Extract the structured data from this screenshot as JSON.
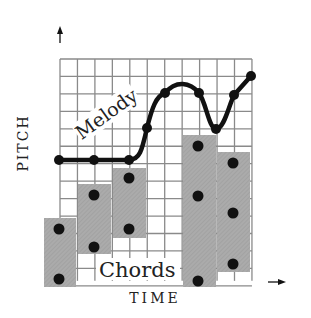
{
  "diagram": {
    "axis_labels": {
      "y": "PITCH",
      "x": "TIME"
    },
    "annotations": {
      "melody": "Melody",
      "chords": "Chords"
    },
    "colors": {
      "grid": "#8a8a8a",
      "chord_block": "#a9a9a9",
      "melody_line": "#111111",
      "dots": "#111111"
    },
    "grid": {
      "x0": 60,
      "y0": 59,
      "cell": 17.45,
      "cols": 11,
      "rows": 13
    },
    "melody_points": [
      [
        59,
        160
      ],
      [
        94,
        160
      ],
      [
        129,
        160
      ],
      [
        147,
        128
      ],
      [
        165,
        93
      ],
      [
        199,
        93
      ],
      [
        216,
        129
      ],
      [
        234,
        95
      ],
      [
        251,
        76
      ]
    ],
    "chords": [
      {
        "x": 44,
        "y": 218,
        "w": 32,
        "h": 69,
        "notes": [
          [
            59,
            229
          ],
          [
            59,
            279
          ]
        ]
      },
      {
        "x": 78,
        "y": 184,
        "w": 33,
        "h": 70,
        "notes": [
          [
            94,
            195
          ],
          [
            94,
            247
          ]
        ]
      },
      {
        "x": 113,
        "y": 168,
        "w": 33,
        "h": 70,
        "notes": [
          [
            129,
            178
          ],
          [
            129,
            229
          ]
        ]
      },
      {
        "x": 183,
        "y": 135,
        "w": 33,
        "h": 152,
        "notes": [
          [
            198,
            146
          ],
          [
            198,
            196
          ],
          [
            198,
            281
          ]
        ]
      },
      {
        "x": 217,
        "y": 152,
        "w": 33,
        "h": 120,
        "notes": [
          [
            233,
            163
          ],
          [
            233,
            213
          ],
          [
            233,
            264
          ]
        ]
      }
    ]
  }
}
